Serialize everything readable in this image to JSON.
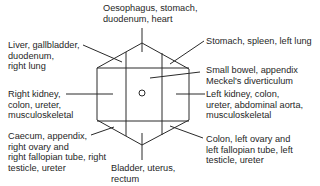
{
  "diagram": {
    "type": "abdominal-pain-regions",
    "center_marker": "umbilicus-circle",
    "line_color": "#2a2a2a",
    "labels": {
      "top": [
        "Oesophagus, stomach,",
        "duodenum, heart"
      ],
      "upper_left": [
        "Liver, gallbladder,",
        "duodenum,",
        "right lung"
      ],
      "upper_right": [
        "Stomach, spleen, left lung"
      ],
      "center": [
        "Small bowel, appendix",
        "Meckel's diverticulum"
      ],
      "left": [
        "Right kidney,",
        "colon, ureter,",
        "musculoskeletal"
      ],
      "right": [
        "Left kidney, colon,",
        "ureter, abdominal aorta,",
        "musculoskeletal"
      ],
      "lower_left": [
        "Caecum, appendix,",
        "right ovary and",
        "right fallopian tube, right",
        "testicle, ureter"
      ],
      "lower_right": [
        "Colon, left ovary and",
        "left fallopian tube, left",
        "testicle, ureter"
      ],
      "bottom": [
        "Bladder, uterus,",
        "rectum"
      ]
    }
  }
}
